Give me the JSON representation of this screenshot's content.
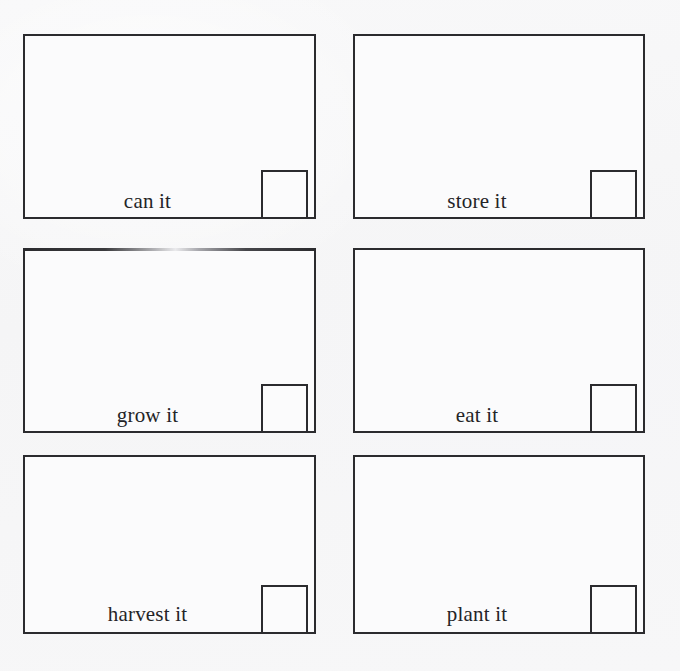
{
  "page": {
    "background_color": "#f7f7f8",
    "ink_color": "#2b2b2e",
    "text_color": "#242427",
    "layout": "2 columns x 3 rows of bordered boxes"
  },
  "grid": {
    "columns": 2,
    "rows": 3,
    "cells": [
      {
        "id": "cell-can-it",
        "label": "can it",
        "row": 0,
        "column": 0,
        "corner_square": true,
        "faded_top_border": false
      },
      {
        "id": "cell-store-it",
        "label": "store it",
        "row": 0,
        "column": 1,
        "corner_square": true,
        "faded_top_border": false
      },
      {
        "id": "cell-grow-it",
        "label": "grow it",
        "row": 1,
        "column": 0,
        "corner_square": true,
        "faded_top_border": true
      },
      {
        "id": "cell-eat-it",
        "label": "eat it",
        "row": 1,
        "column": 1,
        "corner_square": true,
        "faded_top_border": false
      },
      {
        "id": "cell-harvest-it",
        "label": "harvest it",
        "row": 2,
        "column": 0,
        "corner_square": true,
        "faded_top_border": false
      },
      {
        "id": "cell-plant-it",
        "label": "plant it",
        "row": 2,
        "column": 1,
        "corner_square": true,
        "faded_top_border": false
      }
    ]
  }
}
